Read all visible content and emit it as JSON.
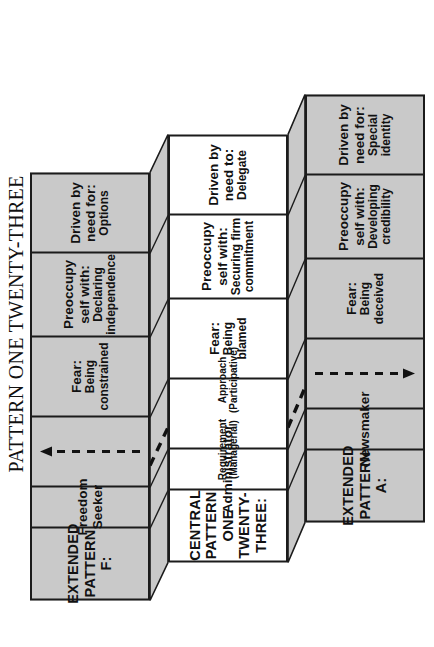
{
  "title": {
    "main": "PATTERN ONE TWENTY-THREE",
    "sub": "Extended Interpretation"
  },
  "panels": [
    {
      "id": "extended-pattern-f",
      "shade": "gray",
      "header": {
        "line1": "EXTENDED",
        "line2": "PATTERN F:"
      },
      "role": "Freedom Seeker",
      "arrow": "dashed-arrow-up",
      "fear": {
        "label": "Fear:",
        "value": "Being constrained"
      },
      "preoccupy": {
        "label": "Preoccupy self with:",
        "value": "Declaring independence"
      },
      "driven": {
        "label": "Driven by need for:",
        "value": "Options"
      }
    },
    {
      "id": "central-pattern-one-twenty-three",
      "shade": "white",
      "header": {
        "line1": "CENTRAL PATTERN",
        "line2": "ONE TWENTY-THREE:"
      },
      "role": "Administrator",
      "requirement": {
        "label": "Requirement",
        "value": "(Managerial)"
      },
      "approach": {
        "label": "Approach",
        "value": "(Participative)"
      },
      "fear": {
        "label": "Fear:",
        "value": "Being blamed"
      },
      "preoccupy": {
        "label": "Preoccupy self with:",
        "value": "Securing firm commitment"
      },
      "driven": {
        "label": "Driven by need to:",
        "value": "Delegate"
      }
    },
    {
      "id": "extended-pattern-a",
      "shade": "gray",
      "header": {
        "line1": "EXTENDED",
        "line2": "PATTERN  A:"
      },
      "role": "Newsmaker",
      "arrow": "dashed-arrow-down",
      "fear": {
        "label": "Fear:",
        "value": "Being deceived"
      },
      "preoccupy": {
        "label": "Preoccupy self with:",
        "value": "Developing credibility"
      },
      "driven": {
        "label": "Driven by need for:",
        "value": "Special identity"
      }
    }
  ],
  "colors": {
    "panel_gray": "#c9c9c9",
    "panel_white": "#ffffff",
    "outline": "#1b1b1b",
    "text": "#111111",
    "band_gray": "#c9c9c9"
  }
}
